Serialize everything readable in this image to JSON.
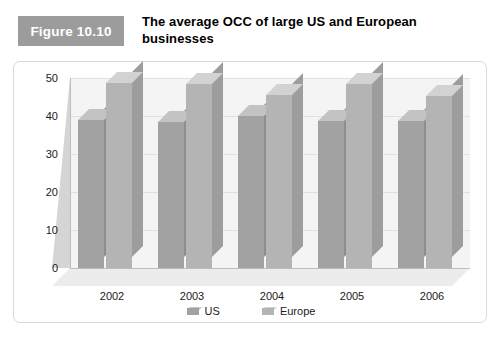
{
  "figure": {
    "badge_label": "Figure 10.10",
    "title": "The average OCC of large US and European businesses",
    "badge_color": "#9c9c9c"
  },
  "legend": {
    "position": "bottom-center",
    "items": [
      {
        "label": "US",
        "color": "#a2a2a2",
        "swatch": "bar-swatch-3d"
      },
      {
        "label": "Europe",
        "color": "#b4b4b4",
        "swatch": "bar-swatch-3d"
      }
    ]
  },
  "chart_data": {
    "type": "bar",
    "title": "The average OCC of large US and European businesses",
    "xlabel": "",
    "ylabel": "",
    "ylim": [
      0,
      50
    ],
    "yticks": [
      0,
      10,
      20,
      30,
      40,
      50
    ],
    "grid": true,
    "three_d": true,
    "categories": [
      "2002",
      "2003",
      "2004",
      "2005",
      "2006"
    ],
    "series": [
      {
        "name": "US",
        "color": "#a2a2a2",
        "values": [
          39.0,
          38.5,
          40.1,
          38.7,
          38.8
        ],
        "labels": [
          "39.0",
          "38.5",
          "40.1",
          "38.7",
          "38.8"
        ]
      },
      {
        "name": "Europe",
        "color": "#b4b4b4",
        "values": [
          48.8,
          48.5,
          45.5,
          48.4,
          45.2
        ],
        "labels": [
          "48.8",
          "48.5",
          "45.5",
          "48.4",
          "45.2"
        ]
      }
    ]
  }
}
